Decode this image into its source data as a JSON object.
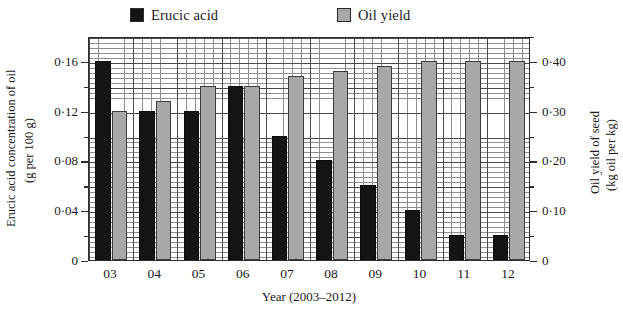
{
  "legend": {
    "entries": [
      {
        "label": "Erucic acid",
        "color": "#141414",
        "name": "erucic-acid"
      },
      {
        "label": "Oil yield",
        "color": "#a8a8a8",
        "name": "oil-yield"
      }
    ]
  },
  "axes": {
    "left_title_line1": "Erucic acid concentration of oil",
    "left_title_line2": "(g per 100 g)",
    "right_title_line1": "Oil yield of seed",
    "right_title_line2": "(kg oil per kg)",
    "x_title": "Year (2003–2012)",
    "left_ticks": [
      "0·16",
      "0·12",
      "0·08",
      "0·04",
      "0"
    ],
    "right_ticks": [
      "0·40",
      "0·30",
      "0·20",
      "0·10",
      "0"
    ]
  },
  "chart_data": {
    "type": "bar",
    "title": "",
    "xlabel": "Year (2003–2012)",
    "ylabel": "Erucic acid concentration of oil (g per 100 g)",
    "y2label": "Oil yield of seed (kg oil per kg)",
    "categories": [
      "03",
      "04",
      "05",
      "06",
      "07",
      "08",
      "09",
      "10",
      "11",
      "12"
    ],
    "ylim": [
      0,
      0.18
    ],
    "y2lim": [
      0,
      0.45
    ],
    "grid": true,
    "legend_position": "top",
    "series": [
      {
        "name": "Erucic acid",
        "axis": "left",
        "unit": "g per 100 g",
        "color": "#141414",
        "values": [
          0.16,
          0.12,
          0.12,
          0.14,
          0.1,
          0.08,
          0.06,
          0.04,
          0.02,
          0.02
        ]
      },
      {
        "name": "Oil yield",
        "axis": "right",
        "unit": "kg oil per kg",
        "color": "#a8a8a8",
        "values": [
          0.3,
          0.32,
          0.35,
          0.35,
          0.37,
          0.38,
          0.39,
          0.4,
          0.4,
          0.4
        ]
      }
    ]
  }
}
